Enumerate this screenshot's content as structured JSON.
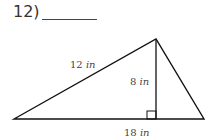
{
  "question": {
    "number_label": "12)"
  },
  "figure": {
    "type": "triangle",
    "labels": {
      "left_side": {
        "value": "12",
        "unit": "in"
      },
      "height": {
        "value": "8",
        "unit": "in"
      },
      "base": {
        "value": "18",
        "unit": "in"
      }
    },
    "right_angle_marker": true
  }
}
